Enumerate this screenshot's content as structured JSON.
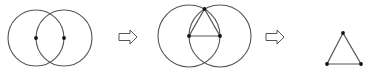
{
  "diagram": {
    "colors": {
      "stroke": "#555555",
      "point": "#111111",
      "background": "#ffffff"
    },
    "steps": [
      {
        "id": "step-1",
        "description": "Two circles of equal radius, each centered on the other's center",
        "circles": [
          {
            "cx": 36,
            "cy": 38,
            "r": 28
          },
          {
            "cx": 64,
            "cy": 38,
            "r": 28
          }
        ],
        "points": [
          {
            "x": 36,
            "y": 38
          },
          {
            "x": 64,
            "y": 38
          }
        ]
      },
      {
        "id": "step-2",
        "description": "Connect centers and top intersection to form triangle",
        "circles": [
          {
            "cx": 189,
            "cy": 36,
            "r": 31
          },
          {
            "cx": 220,
            "cy": 36,
            "r": 31
          }
        ],
        "points": [
          {
            "x": 189,
            "y": 36
          },
          {
            "x": 220,
            "y": 36
          },
          {
            "x": 204.5,
            "y": 9
          }
        ]
      },
      {
        "id": "step-3",
        "description": "Resulting equilateral triangle",
        "points": [
          {
            "x": 343,
            "y": 33
          },
          {
            "x": 327,
            "y": 64
          },
          {
            "x": 361,
            "y": 64
          }
        ]
      }
    ],
    "arrows": [
      {
        "id": "arrow-1",
        "x": 119,
        "y": 37
      },
      {
        "id": "arrow-2",
        "x": 266,
        "y": 37
      }
    ]
  }
}
